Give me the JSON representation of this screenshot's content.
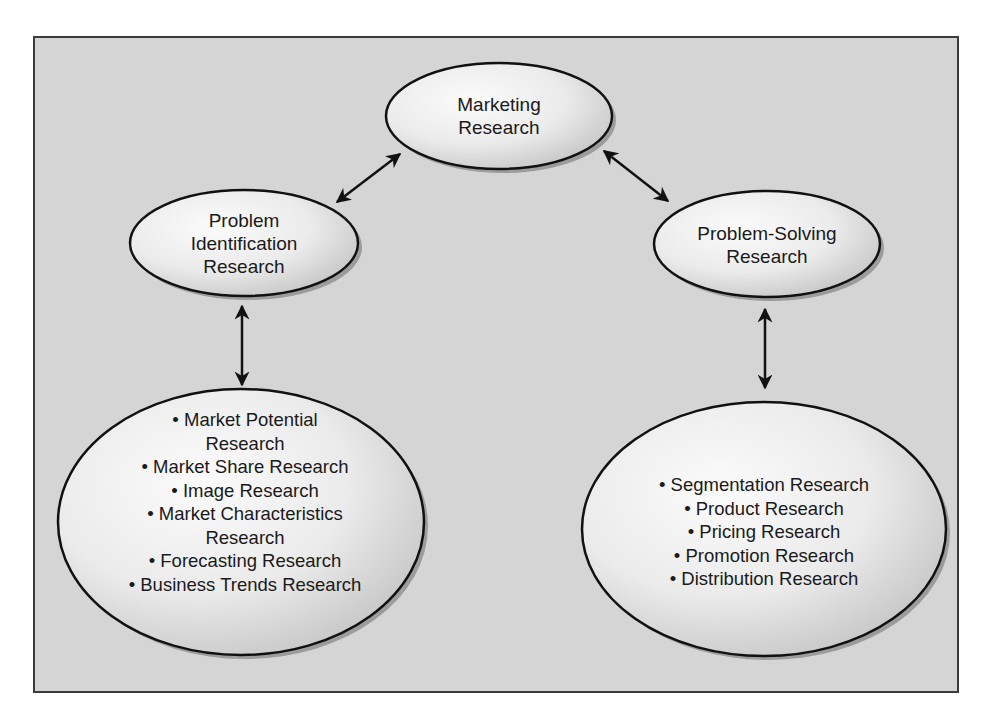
{
  "diagram": {
    "background_color": "#d5d5d5",
    "border_color": "#3a3a3a",
    "ellipse_fill_light": "#fafafa",
    "ellipse_fill_dark": "#c4c4c4",
    "ellipse_stroke": "#111111",
    "nodes": {
      "marketing_research": {
        "lines": [
          "Marketing",
          "Research"
        ]
      },
      "problem_identification": {
        "lines": [
          "Problem",
          "Identification",
          "Research"
        ]
      },
      "problem_solving": {
        "lines": [
          "Problem-Solving",
          "Research"
        ]
      },
      "problem_identification_types": {
        "items": [
          {
            "text": "• Market Potential",
            "continuation": "Research"
          },
          {
            "text": "• Market Share Research"
          },
          {
            "text": "• Image Research"
          },
          {
            "text": "• Market Characteristics",
            "continuation": "Research"
          },
          {
            "text": "• Forecasting Research"
          },
          {
            "text": "• Business Trends Research"
          }
        ]
      },
      "problem_solving_types": {
        "items": [
          {
            "text": "• Segmentation Research"
          },
          {
            "text": "• Product Research"
          },
          {
            "text": "• Pricing Research"
          },
          {
            "text": "• Promotion Research"
          },
          {
            "text": "• Distribution Research"
          }
        ]
      }
    },
    "connections": [
      {
        "from": "marketing_research",
        "to": "problem_identification",
        "type": "bidirectional-arrow"
      },
      {
        "from": "marketing_research",
        "to": "problem_solving",
        "type": "bidirectional-arrow"
      },
      {
        "from": "problem_identification",
        "to": "problem_identification_types",
        "type": "bidirectional-arrow"
      },
      {
        "from": "problem_solving",
        "to": "problem_solving_types",
        "type": "bidirectional-arrow"
      }
    ]
  }
}
